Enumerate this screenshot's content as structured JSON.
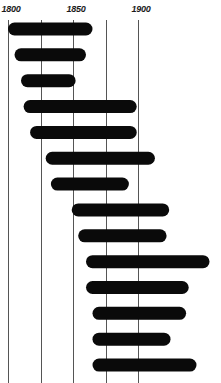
{
  "chart_data": {
    "type": "bar",
    "orientation": "horizontal-range",
    "title": "",
    "xlabel": "",
    "ylabel": "",
    "xlim": [
      1800,
      1960
    ],
    "grid": true,
    "grid_years": [
      1800,
      1825,
      1850,
      1875,
      1900
    ],
    "tick_labels": [
      {
        "year": 1800,
        "label": "1800"
      },
      {
        "year": 1850,
        "label": "1850"
      },
      {
        "year": 1900,
        "label": "1900"
      }
    ],
    "legend": "none",
    "bar_color": "#0a0a0a",
    "series": [
      {
        "name": "span",
        "ranges": [
          [
            1800,
            1865
          ],
          [
            1805,
            1860
          ],
          [
            1810,
            1852
          ],
          [
            1812,
            1899
          ],
          [
            1817,
            1899
          ],
          [
            1829,
            1913
          ],
          [
            1833,
            1893
          ],
          [
            1849,
            1924
          ],
          [
            1854,
            1922
          ],
          [
            1860,
            1955
          ],
          [
            1860,
            1939
          ],
          [
            1865,
            1937
          ],
          [
            1865,
            1925
          ],
          [
            1865,
            1945
          ]
        ]
      }
    ]
  }
}
